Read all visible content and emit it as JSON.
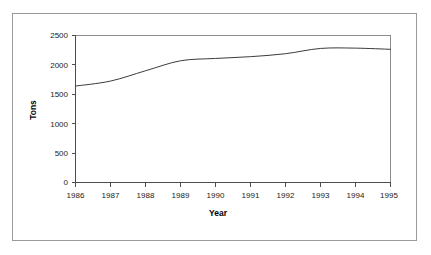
{
  "chart_data": {
    "type": "line",
    "title": "",
    "xlabel": "Year",
    "ylabel": "Tons",
    "categories": [
      1986,
      1987,
      1988,
      1989,
      1990,
      1991,
      1992,
      1993,
      1994,
      1995
    ],
    "x_tick_labels": [
      "1986",
      "1987",
      "1988",
      "1989",
      "1990",
      "1991",
      "1992",
      "1993",
      "1994",
      "1995"
    ],
    "y_tick_labels": [
      "0",
      "500",
      "1000",
      "1500",
      "2000",
      "2500"
    ],
    "y_ticks": [
      0,
      500,
      1000,
      1500,
      2000,
      2500
    ],
    "ylim": [
      0,
      2500
    ],
    "xlim": [
      1986,
      1995
    ],
    "grid": false,
    "legend": null,
    "series": [
      {
        "name": "Tons",
        "values": [
          1640,
          1725,
          1900,
          2070,
          2110,
          2140,
          2190,
          2280,
          2285,
          2265
        ]
      }
    ],
    "line_color": "#3c3c3c",
    "axis_color": "#4d4d4d",
    "frame_color": "#8c8c8c",
    "background_color": "#ffffff"
  },
  "figure": {
    "outer_border_color": "#9a9a9a"
  }
}
